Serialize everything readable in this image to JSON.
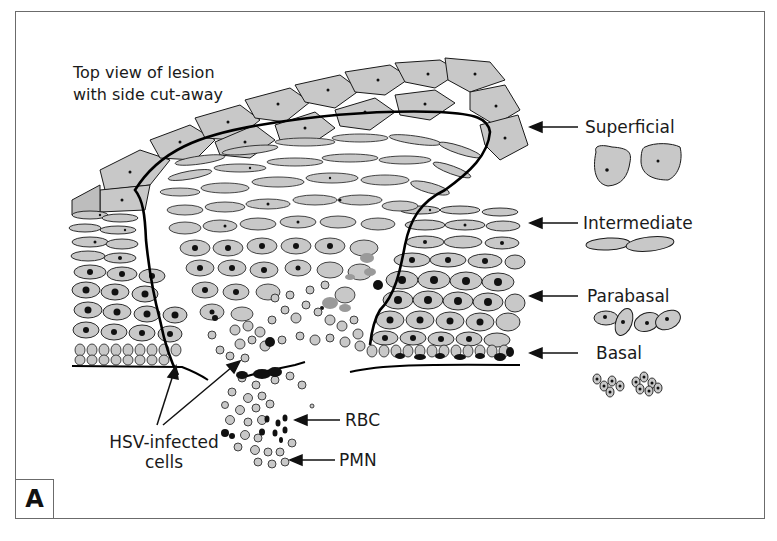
{
  "diagram": {
    "panel_label": "A",
    "caption": {
      "line1": "Top view of lesion",
      "line2": "with side cut-away"
    },
    "layers": [
      {
        "id": "superficial",
        "label": "Superficial"
      },
      {
        "id": "intermediate",
        "label": "Intermediate"
      },
      {
        "id": "parabasal",
        "label": "Parabasal"
      },
      {
        "id": "basal",
        "label": "Basal"
      }
    ],
    "cell_labels": {
      "rbc": "RBC",
      "pmn": "PMN",
      "hsv_line1": "HSV-infected",
      "hsv_line2": "cells"
    },
    "colors": {
      "cell_fill": "#c8c8c8",
      "cell_stroke": "#1a1a1a",
      "nucleus": "#111111",
      "frame": "#6b6b6b",
      "lesion_outline": "#000000",
      "infected_gray": "#9a9a9a"
    }
  }
}
